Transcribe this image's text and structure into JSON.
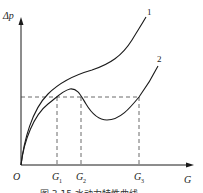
{
  "diagram": {
    "y_axis_label": "Δp",
    "x_axis_label": "G",
    "origin_label": "O",
    "curves": [
      {
        "id": "1",
        "label": "1"
      },
      {
        "id": "2",
        "label": "2"
      }
    ],
    "x_marks": [
      {
        "label": "G",
        "sub": "1"
      },
      {
        "label": "G",
        "sub": "2"
      },
      {
        "label": "G",
        "sub": "3"
      }
    ],
    "caption": "图 3.15  水动力特性曲线"
  }
}
